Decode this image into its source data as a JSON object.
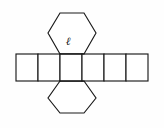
{
  "figure": {
    "background_color": "#fefefe",
    "stroke_color": "#1a1a1a",
    "fill_color": "#ffffff",
    "width": 164,
    "height": 128
  },
  "labels": {
    "edge_length": "ℓ"
  },
  "diagram_data": {
    "type": "geometric-net",
    "solid": "hexagonal prism",
    "faces": {
      "lateral_rectangles": 6,
      "hexagon_bases": 2
    },
    "rectangle_strip": {
      "x_left": 16,
      "x_right": 148,
      "y_top": 54,
      "y_bottom": 81,
      "cell_count": 6,
      "cell_dividers_x": [
        38,
        60,
        82,
        104,
        126
      ]
    },
    "hexagon_top": {
      "attached_to_cell": 3,
      "points": "60,54 48,33 60,13 84,13 96,33 84,54"
    },
    "hexagon_bottom": {
      "attached_to_cell": 3,
      "points": "60,81 48,98 60,113 84,113 96,98 84,81"
    },
    "annotation": {
      "text": "ℓ",
      "x": 68,
      "y": 37,
      "meaning": "edge length label inside top hexagon"
    }
  }
}
